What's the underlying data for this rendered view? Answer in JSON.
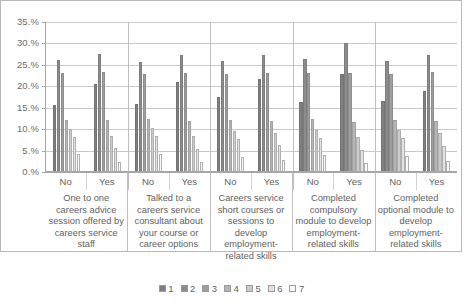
{
  "chart_data": {
    "type": "bar",
    "title": "",
    "subtitle": "",
    "xlabel": "",
    "ylabel": "",
    "ylim": [
      0,
      35
    ],
    "ytick_values": [
      0,
      5,
      10,
      15,
      20,
      25,
      30,
      35
    ],
    "ytick_labels": [
      "0.%",
      "5.%",
      "10.%",
      "15.%",
      "20.%",
      "25.%",
      "30.%",
      "35.%"
    ],
    "grid": true,
    "legend_position": "bottom",
    "legend": [
      "1",
      "2",
      "3",
      "4",
      "5",
      "6",
      "7"
    ],
    "series_colors": [
      "#808080",
      "#8c8c8c",
      "#9e9e9e",
      "#b5b5b5",
      "#cccccc",
      "#e2e2e2",
      "#fafafa"
    ],
    "groups": [
      {
        "question": "One to one careers advice session offered by careers service staff",
        "subgroups": [
          {
            "label": "No",
            "values": [
              15.6,
              26.2,
              23.0,
              12.2,
              10.0,
              8.2,
              4.1
            ]
          },
          {
            "label": "Yes",
            "values": [
              20.5,
              27.6,
              23.3,
              12.1,
              8.5,
              5.5,
              2.4
            ]
          }
        ]
      },
      {
        "question": "Talked to a careers service consultant about your course or career options",
        "subgroups": [
          {
            "label": "No",
            "values": [
              15.9,
              25.7,
              22.8,
              12.4,
              10.2,
              8.4,
              4.3
            ]
          },
          {
            "label": "Yes",
            "values": [
              21.0,
              27.4,
              23.2,
              11.9,
              8.3,
              5.3,
              2.3
            ]
          }
        ]
      },
      {
        "question": "Careers service short courses or sessions to develop employment-related skills",
        "subgroups": [
          {
            "label": "No",
            "values": [
              17.4,
              26.0,
              22.9,
              12.1,
              9.6,
              7.6,
              3.6
            ]
          },
          {
            "label": "Yes",
            "values": [
              21.6,
              27.3,
              23.1,
              11.8,
              9.0,
              6.2,
              2.8
            ]
          }
        ]
      },
      {
        "question": "Completed compulsory module to develop employment-related skills",
        "subgroups": [
          {
            "label": "No",
            "values": [
              16.3,
              26.3,
              23.0,
              12.3,
              9.9,
              8.0,
              3.9
            ]
          },
          {
            "label": "Yes",
            "values": [
              22.8,
              30.0,
              23.2,
              11.6,
              8.1,
              5.1,
              2.2
            ]
          }
        ]
      },
      {
        "question": "Completed optional module to develop employment-related skills",
        "subgroups": [
          {
            "label": "No",
            "values": [
              16.6,
              26.0,
              22.8,
              12.2,
              9.8,
              7.9,
              3.8
            ]
          },
          {
            "label": "Yes",
            "values": [
              18.8,
              27.2,
              23.3,
              12.0,
              9.0,
              6.0,
              2.6
            ]
          }
        ]
      }
    ]
  }
}
